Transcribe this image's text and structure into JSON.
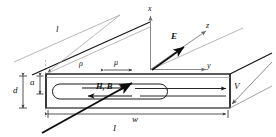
{
  "figure": {
    "background_color": "#ffffff",
    "line_color": "#1a1a1a",
    "thin_line_color": "#8a8a8a",
    "width": 276,
    "height": 137
  },
  "axes": {
    "x": {
      "label": "x",
      "direction": "up"
    },
    "y": {
      "label": "y",
      "direction": "right"
    },
    "z": {
      "label": "z",
      "direction": "upper-right-oblique"
    }
  },
  "vectors": {
    "E": {
      "label": "E",
      "style": "bold-italic",
      "description": "electric field vector arrow pointing upper right"
    },
    "HB": {
      "label": "H, B",
      "style": "bold-italic",
      "description": "magnetic field and flux density arrows pointing right inside slab"
    },
    "I": {
      "label": "I",
      "style": "italic",
      "description": "current arrow pointing upper right through slab"
    },
    "V": {
      "label": "V",
      "style": "italic",
      "description": "velocity arrow pointing lower left along slab edge"
    }
  },
  "dimensions": {
    "length": {
      "label": "l",
      "description": "slab length along z, top edge"
    },
    "width": {
      "label": "w",
      "description": "slab width along y, bottom edge"
    },
    "thickness": {
      "label": "d",
      "description": "total slab thickness, left side outer"
    },
    "inner_thickness": {
      "label": "a",
      "description": "inner layer thickness, left side inner"
    },
    "resistivity": {
      "label": "ρ",
      "description": "resistivity symbol rho on slab face"
    },
    "mobility": {
      "label": "μ",
      "description": "mobility symbol mu with double headed arrow"
    }
  }
}
